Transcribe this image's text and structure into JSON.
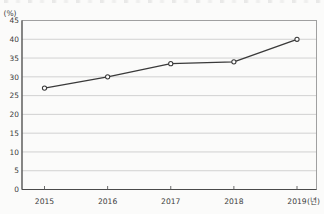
{
  "chart_data": {
    "type": "line",
    "categories": [
      "2015",
      "2016",
      "2017",
      "2018",
      "2019"
    ],
    "values": [
      27,
      30,
      33.5,
      34,
      40
    ],
    "title": "",
    "ylabel": "(%)",
    "xlabel": "(년)",
    "ylim": [
      0,
      45
    ],
    "ytick_step": 5,
    "yticks": [
      0,
      5,
      10,
      15,
      20,
      25,
      30,
      35,
      40,
      45
    ],
    "grid": true,
    "legend": "none",
    "marker": "open-circle",
    "colors": {
      "line": "#3a3a3a",
      "marker_fill": "#ffffff",
      "marker_stroke": "#3a3a3a",
      "grid": "#c6c6c6",
      "border": "#979797",
      "axis": "#4a4a4a",
      "tick": "#5a5a5a",
      "label": "#3c3c3c",
      "background": "#fbfbfa"
    }
  }
}
